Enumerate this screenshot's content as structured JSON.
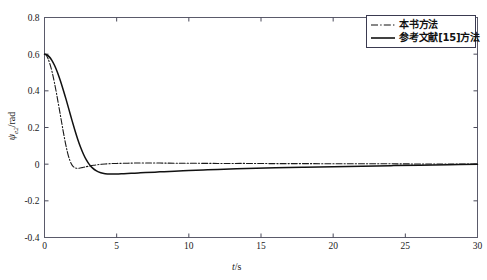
{
  "chart_data": {
    "type": "line",
    "title": "",
    "subtitle": "",
    "xlabel": "t/s",
    "ylabel": "ψe2/rad",
    "xlim": [
      0,
      30
    ],
    "ylim": [
      -0.4,
      0.8
    ],
    "xticks": [
      0,
      5,
      10,
      15,
      20,
      25,
      30
    ],
    "xtick_labels": [
      "0",
      "5",
      "10",
      "15",
      "20",
      "25",
      "30"
    ],
    "yticks": [
      -0.4,
      -0.2,
      0,
      0.2,
      0.4,
      0.6,
      0.8
    ],
    "ytick_labels": [
      "-0.4",
      "-0.2",
      "0",
      "0.2",
      "0.4",
      "0.6",
      "0.8"
    ],
    "grid": false,
    "legend_position": "top-right",
    "series": [
      {
        "name": "本书方法",
        "style": "dash-dot",
        "color": "#1a1a1a",
        "x": [
          0,
          0.12,
          0.25,
          0.4,
          0.55,
          0.7,
          0.85,
          1.0,
          1.15,
          1.3,
          1.45,
          1.6,
          1.75,
          1.9,
          2.05,
          2.2,
          2.4,
          2.6,
          2.8,
          3.0,
          3.4,
          3.8,
          4.2,
          4.6,
          5.0,
          5.6,
          6.2,
          7.0,
          8.0,
          9.0,
          10.0,
          12.0,
          14.0,
          16.0,
          18.0,
          20.0,
          22.0,
          24.0,
          26.0,
          28.0,
          30.0
        ],
        "y": [
          0.6,
          0.594,
          0.575,
          0.54,
          0.495,
          0.44,
          0.378,
          0.312,
          0.245,
          0.178,
          0.115,
          0.062,
          0.022,
          -0.004,
          -0.017,
          -0.022,
          -0.022,
          -0.019,
          -0.015,
          -0.012,
          -0.006,
          -0.002,
          0.001,
          0.003,
          0.004,
          0.005,
          0.006,
          0.006,
          0.006,
          0.005,
          0.005,
          0.004,
          0.004,
          0.003,
          0.003,
          0.002,
          0.002,
          0.002,
          0.001,
          0.001,
          0.0
        ]
      },
      {
        "name": "参考文献[15]方法",
        "style": "solid",
        "color": "#111111",
        "x": [
          0,
          0.15,
          0.3,
          0.5,
          0.7,
          0.9,
          1.1,
          1.3,
          1.5,
          1.7,
          1.9,
          2.1,
          2.3,
          2.5,
          2.7,
          2.9,
          3.1,
          3.3,
          3.6,
          3.9,
          4.2,
          4.6,
          5.0,
          5.5,
          6.0,
          6.5,
          7.0,
          8.0,
          9.0,
          10.0,
          11.0,
          12.0,
          14.0,
          16.0,
          18.0,
          20.0,
          22.0,
          24.0,
          26.0,
          28.0,
          30.0
        ],
        "y": [
          0.6,
          0.597,
          0.588,
          0.568,
          0.538,
          0.5,
          0.455,
          0.405,
          0.352,
          0.296,
          0.24,
          0.186,
          0.136,
          0.092,
          0.054,
          0.023,
          -0.001,
          -0.019,
          -0.037,
          -0.047,
          -0.052,
          -0.054,
          -0.054,
          -0.052,
          -0.05,
          -0.048,
          -0.046,
          -0.042,
          -0.038,
          -0.035,
          -0.032,
          -0.029,
          -0.024,
          -0.02,
          -0.017,
          -0.014,
          -0.011,
          -0.008,
          -0.006,
          -0.003,
          -0.001
        ]
      }
    ]
  },
  "legend": {
    "items": [
      {
        "label": "本书方法",
        "style": "dash-dot"
      },
      {
        "label": "参考文献[15]方法",
        "style": "solid"
      }
    ]
  },
  "axes": {
    "x_title_main": "t",
    "x_title_rest": "/s",
    "y_title_sym": "ψ",
    "y_title_sub": "e2",
    "y_title_rest": "/rad"
  },
  "colors": {
    "axis": "#4a4a5a",
    "curve": "#111111",
    "legend_border": "#3a3a50",
    "background": "#ffffff"
  }
}
